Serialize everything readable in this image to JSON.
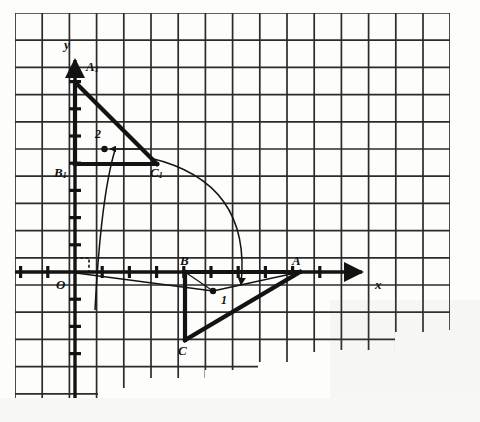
{
  "figure": {
    "kind": "geometry-diagram",
    "background_color": "#fdfdfb",
    "ink_color": "#131313",
    "grid": {
      "cell_px": 27.2,
      "left": 15,
      "top": 13,
      "right": 450,
      "bottom": 350,
      "line_color": "#2a2a2a",
      "line_width": 1.6
    },
    "axes": {
      "x_label": "x",
      "y_label": "y",
      "origin_label": "O",
      "origin_px": {
        "x": 75,
        "y": 272
      },
      "x_axis_y": 272,
      "y_axis_x": 75,
      "x_arrow_end": 366,
      "y_arrow_end": 56,
      "tick_spacing_px": 27.2,
      "right_angle_mark": true
    },
    "triangles": [
      {
        "name": "ABC",
        "vertices": [
          {
            "label": "A",
            "x": 300,
            "y": 272
          },
          {
            "label": "B",
            "x": 185,
            "y": 272
          },
          {
            "label": "C",
            "x": 185,
            "y": 340
          }
        ],
        "stroke_width": 4
      },
      {
        "name": "A1B1C1",
        "vertices": [
          {
            "label": "A1",
            "x": 75,
            "y": 82
          },
          {
            "label": "B1",
            "x": 75,
            "y": 164
          },
          {
            "label": "C1",
            "x": 157,
            "y": 164
          }
        ],
        "stroke_width": 4
      }
    ],
    "arcs": [
      {
        "id": "arc-1",
        "label": "1",
        "from": "C1",
        "to": "near-B-below-axis",
        "label_x": 224,
        "label_y": 300
      },
      {
        "id": "arc-2",
        "label": "2",
        "from": "origin-region",
        "to": "y-axis-point",
        "label_x": 97,
        "label_y": 137
      }
    ],
    "labels": [
      {
        "name": "label-y-axis",
        "text": "y",
        "sub": "",
        "x": 68,
        "y": 48
      },
      {
        "name": "label-x-axis",
        "text": "x",
        "sub": "",
        "x": 378,
        "y": 287
      },
      {
        "name": "label-origin",
        "text": "O",
        "sub": "",
        "x": 59,
        "y": 290
      },
      {
        "name": "label-A1",
        "text": "A",
        "sub": "1",
        "x": 88,
        "y": 72
      },
      {
        "name": "label-B1",
        "text": "B",
        "sub": "1",
        "x": 56,
        "y": 180
      },
      {
        "name": "label-C1",
        "text": "C",
        "sub": "1",
        "x": 152,
        "y": 180
      },
      {
        "name": "label-A",
        "text": "A",
        "sub": "",
        "x": 294,
        "y": 267
      },
      {
        "name": "label-B",
        "text": "B",
        "sub": "",
        "x": 181,
        "y": 267
      },
      {
        "name": "label-C",
        "text": "C",
        "sub": "",
        "x": 180,
        "y": 358
      },
      {
        "name": "label-arc-1",
        "text": "1",
        "sub": "",
        "x": 224,
        "y": 304
      },
      {
        "name": "label-arc-2",
        "text": "2",
        "sub": "",
        "x": 97,
        "y": 139
      }
    ]
  }
}
